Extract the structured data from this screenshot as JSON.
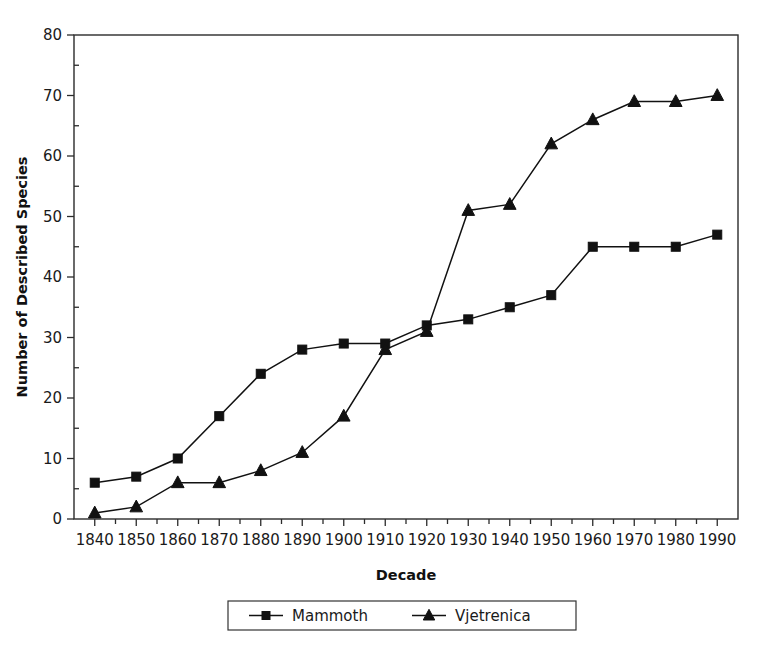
{
  "chart_data": {
    "type": "line",
    "title": "",
    "xlabel": "Decade",
    "ylabel": "Number of Described Species",
    "categories": [
      "1840",
      "1850",
      "1860",
      "1870",
      "1880",
      "1890",
      "1900",
      "1910",
      "1920",
      "1930",
      "1940",
      "1950",
      "1960",
      "1970",
      "1980",
      "1990"
    ],
    "x": [
      1840,
      1850,
      1860,
      1870,
      1880,
      1890,
      1900,
      1910,
      1920,
      1930,
      1940,
      1950,
      1960,
      1970,
      1980,
      1990
    ],
    "series": [
      {
        "name": "Mammoth",
        "marker": "square",
        "color": "#111111",
        "values": [
          6,
          7,
          10,
          17,
          24,
          28,
          29,
          29,
          32,
          33,
          35,
          37,
          45,
          45,
          45,
          47
        ]
      },
      {
        "name": "Vjetrenica",
        "marker": "triangle",
        "color": "#111111",
        "values": [
          1,
          2,
          6,
          6,
          8,
          11,
          17,
          28,
          31,
          51,
          52,
          62,
          66,
          69,
          69,
          70
        ]
      }
    ],
    "ylim": [
      0,
      80
    ],
    "yticks": [
      0,
      10,
      20,
      30,
      40,
      50,
      60,
      70,
      80
    ],
    "ytick_labels": [
      "0",
      "10",
      "20",
      "30",
      "40",
      "50",
      "60",
      "70",
      "80"
    ],
    "xlim": [
      1835,
      1995
    ],
    "grid": false,
    "legend_position": "bottom-center",
    "legend_entries": [
      "Mammoth",
      "Vjetrenica"
    ]
  },
  "axes": {
    "y_title": "Number of Described Species",
    "x_title": "Decade"
  },
  "legend": {
    "items": [
      {
        "label": "Mammoth"
      },
      {
        "label": "Vjetrenica"
      }
    ]
  }
}
